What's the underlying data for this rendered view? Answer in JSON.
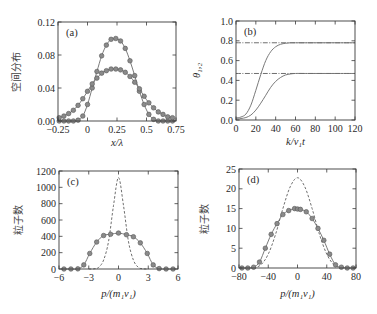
{
  "colors": {
    "solid_line": "#7a7a7a",
    "dashed_line": "#6f6f6f",
    "marker_fill": "#8a8a8a",
    "frame": "#3a3a3a"
  },
  "chart_data": [
    {
      "id": "a",
      "type": "line",
      "panel_label": "(a)",
      "xlabel": "x/λ",
      "ylabel": "空间分布",
      "xlim": [
        -0.25,
        0.75
      ],
      "ylim": [
        0.0,
        0.12
      ],
      "xticks": [
        -0.25,
        0,
        0.25,
        0.5,
        0.75
      ],
      "xtick_labels": [
        "−0.25",
        "0",
        "0.25",
        "0.5",
        "0.75"
      ],
      "yticks": [
        0.0,
        0.04,
        0.08,
        0.12
      ],
      "ytick_labels": [
        "0.00",
        "0.04",
        "0.08",
        "0.12"
      ],
      "grid": false,
      "series": [
        {
          "name": "narrow",
          "style": "solid+markers",
          "x": [
            -0.24,
            -0.2,
            -0.16,
            -0.12,
            -0.08,
            -0.04,
            0.0,
            0.04,
            0.08,
            0.12,
            0.16,
            0.2,
            0.24,
            0.28,
            0.32,
            0.36,
            0.4,
            0.44,
            0.48,
            0.52,
            0.56,
            0.6,
            0.64,
            0.68,
            0.72
          ],
          "y": [
            0.0,
            0.0,
            0.0,
            0.0,
            0.001,
            0.006,
            0.02,
            0.04,
            0.06,
            0.079,
            0.092,
            0.099,
            0.1,
            0.097,
            0.088,
            0.073,
            0.055,
            0.036,
            0.02,
            0.008,
            0.002,
            0.0,
            0.0,
            0.0,
            0.0
          ]
        },
        {
          "name": "wide",
          "style": "solid+markers",
          "x": [
            -0.24,
            -0.2,
            -0.16,
            -0.12,
            -0.08,
            -0.04,
            0.0,
            0.04,
            0.08,
            0.12,
            0.16,
            0.2,
            0.24,
            0.28,
            0.32,
            0.36,
            0.4,
            0.44,
            0.48,
            0.52,
            0.56,
            0.6,
            0.64,
            0.68,
            0.72
          ],
          "y": [
            0.004,
            0.006,
            0.009,
            0.013,
            0.019,
            0.027,
            0.036,
            0.045,
            0.052,
            0.058,
            0.061,
            0.063,
            0.063,
            0.062,
            0.059,
            0.054,
            0.047,
            0.039,
            0.03,
            0.022,
            0.016,
            0.011,
            0.008,
            0.005,
            0.004
          ]
        }
      ]
    },
    {
      "id": "b",
      "type": "line",
      "panel_label": "(b)",
      "xlabel": "k/v₁t",
      "ylabel": "θ₁,₂",
      "xlim": [
        0,
        120
      ],
      "ylim": [
        0.0,
        1.0
      ],
      "xticks": [
        0,
        20,
        40,
        60,
        80,
        100,
        120
      ],
      "xtick_labels": [
        "0",
        "20",
        "40",
        "60",
        "80",
        "100",
        "120"
      ],
      "yticks": [
        0.0,
        0.2,
        0.4,
        0.6,
        0.8,
        1.0
      ],
      "ytick_labels": [
        "0.0",
        "0.2",
        "0.4",
        "0.6",
        "0.8",
        "1.0"
      ],
      "grid": false,
      "series": [
        {
          "name": "θ1",
          "style": "solid",
          "x": [
            0,
            5,
            10,
            15,
            20,
            25,
            30,
            35,
            40,
            45,
            50,
            55,
            60,
            70,
            80,
            100,
            120
          ],
          "y": [
            0.02,
            0.03,
            0.06,
            0.15,
            0.3,
            0.46,
            0.6,
            0.69,
            0.74,
            0.765,
            0.775,
            0.78,
            0.78,
            0.78,
            0.78,
            0.78,
            0.78
          ]
        },
        {
          "name": "θ2",
          "style": "solid",
          "x": [
            0,
            5,
            10,
            15,
            20,
            25,
            30,
            35,
            40,
            45,
            50,
            55,
            60,
            70,
            80,
            100,
            120
          ],
          "y": [
            0.01,
            0.015,
            0.025,
            0.05,
            0.1,
            0.17,
            0.25,
            0.33,
            0.39,
            0.43,
            0.455,
            0.465,
            0.47,
            0.47,
            0.47,
            0.47,
            0.47
          ]
        },
        {
          "name": "θ1 asymptote",
          "style": "dash-dot",
          "x": [
            0,
            120
          ],
          "y": [
            0.78,
            0.78
          ]
        },
        {
          "name": "θ2 asymptote",
          "style": "dash-dot",
          "x": [
            0,
            120
          ],
          "y": [
            0.47,
            0.47
          ]
        }
      ]
    },
    {
      "id": "c",
      "type": "line",
      "panel_label": "(c)",
      "xlabel": "p/(m₁v₁)",
      "ylabel": "粒子数",
      "xlim": [
        -6,
        6
      ],
      "ylim": [
        0,
        1200
      ],
      "xticks": [
        -6,
        -3,
        0,
        3,
        6
      ],
      "xtick_labels": [
        "−6",
        "−3",
        "0",
        "3",
        "6"
      ],
      "yticks": [
        0,
        200,
        400,
        600,
        800,
        1000,
        1200
      ],
      "ytick_labels": [
        "0",
        "200",
        "400",
        "600",
        "800",
        "1000",
        "1200"
      ],
      "grid": false,
      "series": [
        {
          "name": "initial",
          "style": "dashed",
          "x": [
            -3,
            -2.5,
            -2,
            -1.5,
            -1,
            -0.5,
            0,
            0.5,
            1,
            1.5,
            2,
            2.5,
            3
          ],
          "y": [
            0,
            2,
            20,
            110,
            340,
            780,
            1120,
            780,
            340,
            110,
            20,
            2,
            0
          ]
        },
        {
          "name": "final",
          "style": "solid+markers",
          "x": [
            -5.5,
            -4.8,
            -4.1,
            -3.5,
            -2.9,
            -2.2,
            -1.5,
            -0.8,
            0,
            0.8,
            1.5,
            2.2,
            2.9,
            3.5,
            4.1,
            4.8,
            5.5
          ],
          "y": [
            0,
            0,
            2,
            50,
            190,
            330,
            410,
            425,
            440,
            420,
            395,
            320,
            190,
            50,
            5,
            0,
            0
          ]
        }
      ]
    },
    {
      "id": "d",
      "type": "line",
      "panel_label": "(d)",
      "xlabel": "p/(m₁v₁)",
      "ylabel": "粒子数",
      "xlim": [
        -80,
        80
      ],
      "ylim": [
        0,
        25
      ],
      "xticks": [
        -80,
        -40,
        0,
        40,
        80
      ],
      "xtick_labels": [
        "−80",
        "−40",
        "0",
        "40",
        "80"
      ],
      "yticks": [
        0,
        5,
        10,
        15,
        20,
        25
      ],
      "ytick_labels": [
        "0",
        "5",
        "10",
        "15",
        "20",
        "25"
      ],
      "grid": false,
      "series": [
        {
          "name": "initial",
          "style": "dashed",
          "x": [
            -60,
            -50,
            -40,
            -30,
            -20,
            -10,
            0,
            10,
            20,
            30,
            40,
            50,
            60
          ],
          "y": [
            0,
            0.8,
            3.5,
            8.5,
            15,
            20.5,
            22.8,
            20.5,
            15,
            8.5,
            3.5,
            0.8,
            0
          ]
        },
        {
          "name": "final",
          "style": "solid+markers",
          "x": [
            -76,
            -68,
            -60,
            -52,
            -44,
            -36,
            -28,
            -20,
            -12,
            -4,
            0,
            4,
            12,
            20,
            28,
            36,
            44,
            52,
            60,
            68,
            76
          ],
          "y": [
            0,
            0,
            0.2,
            1.5,
            5,
            8.5,
            11.2,
            13.5,
            14.5,
            15,
            14.9,
            14.8,
            14.2,
            12.5,
            10,
            7,
            3.5,
            0.8,
            0.2,
            0,
            0
          ]
        }
      ]
    }
  ]
}
